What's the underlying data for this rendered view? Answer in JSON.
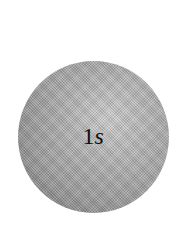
{
  "diagram": {
    "type": "atomic-orbital",
    "shape": "sphere",
    "label": {
      "number": "1",
      "letter": "s"
    },
    "colors": {
      "background": "#ffffff",
      "sphere_light": "#d2d2d2",
      "sphere_mid": "#a6a6a6",
      "sphere_dark": "#7a7a7a",
      "label": "#111111"
    }
  }
}
